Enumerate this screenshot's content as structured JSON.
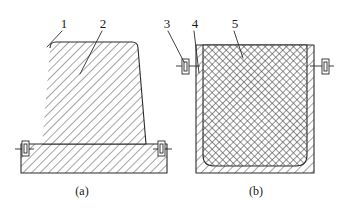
{
  "figure": {
    "type": "engineering-cross-section-drawing",
    "background_color": "#ffffff",
    "line_color": "#2b2b2b",
    "hatch_color": "#555555",
    "subfigures": [
      {
        "id": "a",
        "caption": "(a)",
        "description": "trapezoidal hatched body on rectangular hatched base with side clamps",
        "callouts": [
          {
            "label": "1",
            "x": 64,
            "y": 27
          },
          {
            "label": "2",
            "x": 103,
            "y": 27
          }
        ]
      },
      {
        "id": "b",
        "caption": "(b)",
        "description": "rectangular hatched mold with cross-hatched core and side clamps",
        "callouts": [
          {
            "label": "3",
            "x": 167,
            "y": 27
          },
          {
            "label": "4",
            "x": 195,
            "y": 27
          },
          {
            "label": "5",
            "x": 235,
            "y": 27
          }
        ]
      }
    ],
    "callout_labels": [
      "1",
      "2",
      "3",
      "4",
      "5"
    ],
    "captions": {
      "left": "(a)",
      "right": "(b)"
    }
  }
}
